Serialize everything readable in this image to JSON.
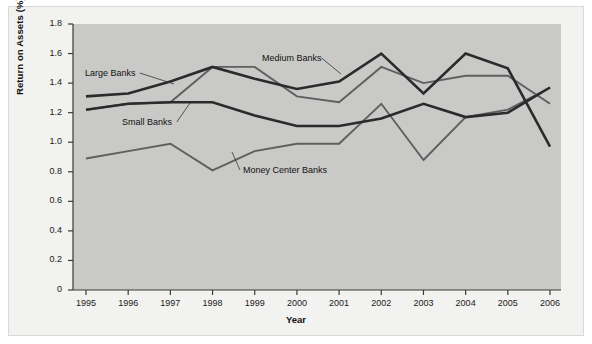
{
  "figure": {
    "background_color": "#f2f2f0",
    "plot_background_color": "#c9c9c7",
    "line_color_dark": "#2b2b2b",
    "line_color_mid": "#5f5f5f"
  },
  "chart_data": {
    "type": "line",
    "title": "",
    "xlabel": "Year",
    "ylabel": "Return on Assets (%)",
    "x": [
      1995,
      1996,
      1997,
      1998,
      1999,
      2000,
      2001,
      2002,
      2003,
      2004,
      2005,
      2006
    ],
    "categories": [
      "1995",
      "1996",
      "1997",
      "1998",
      "1999",
      "2000",
      "2001",
      "2002",
      "2003",
      "2004",
      "2005",
      "2006"
    ],
    "xtick_labels": [
      "1995",
      "1996",
      "1997",
      "1998",
      "1999",
      "2000",
      "2001",
      "2002",
      "2003",
      "2004",
      "2005",
      "2006"
    ],
    "ytick_labels": [
      "0",
      "0.2",
      "0.4",
      "0.6",
      "0.8",
      "1.0",
      "1.2",
      "1.4",
      "1.6",
      "1.8"
    ],
    "ytick_values": [
      0,
      0.2,
      0.4,
      0.6,
      0.8,
      1.0,
      1.2,
      1.4,
      1.6,
      1.8
    ],
    "ylim": [
      0,
      1.8
    ],
    "xlim": [
      1995,
      2006
    ],
    "grid": false,
    "legend": "inline-annotations",
    "legend_position": "in-plot",
    "series": [
      {
        "name": "Large Banks",
        "style": "dark-thick",
        "values": [
          1.31,
          1.33,
          1.41,
          1.51,
          1.43,
          1.36,
          1.41,
          1.6,
          1.33,
          1.6,
          1.5,
          0.97
        ]
      },
      {
        "name": "Medium Banks",
        "style": "mid-thin",
        "values": [
          1.22,
          1.26,
          1.27,
          1.51,
          1.51,
          1.31,
          1.27,
          1.51,
          1.4,
          1.45,
          1.45,
          1.26
        ]
      },
      {
        "name": "Small Banks",
        "style": "dark-thick",
        "values": [
          1.22,
          1.26,
          1.27,
          1.27,
          1.18,
          1.11,
          1.11,
          1.16,
          1.26,
          1.17,
          1.2,
          1.37
        ]
      },
      {
        "name": "Money Center Banks",
        "style": "mid-thin",
        "values": [
          0.89,
          0.94,
          0.99,
          0.81,
          0.94,
          0.99,
          0.99,
          1.26,
          0.88,
          1.17,
          1.22,
          1.37
        ]
      }
    ],
    "annotations": [
      {
        "text": "Large Banks",
        "x_px": 85,
        "y_px": 68,
        "leader_to_x": 174,
        "leader_to_y": 84
      },
      {
        "text": "Medium Banks",
        "x_px": 262,
        "y_px": 53,
        "leader_to_x": 341,
        "leader_to_y": 74
      },
      {
        "text": "Small Banks",
        "x_px": 122,
        "y_px": 117,
        "leader_to_x": 190,
        "leader_to_y": 103
      },
      {
        "text": "Money Center Banks",
        "x_px": 243,
        "y_px": 165,
        "leader_to_x": 232,
        "leader_to_y": 152
      }
    ]
  }
}
